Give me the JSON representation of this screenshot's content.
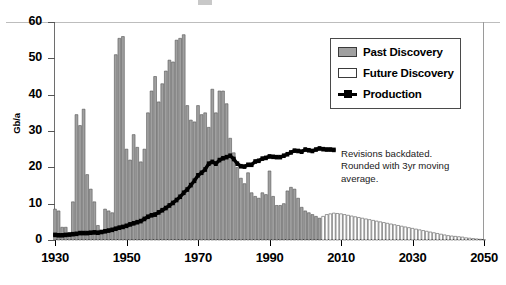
{
  "chart_data": {
    "type": "bar",
    "title": "",
    "xlabel": "",
    "ylabel": "Gb/a",
    "xlim": [
      1930,
      2050
    ],
    "ylim": [
      0,
      60
    ],
    "grid": false,
    "legend_position": "top-right",
    "y_ticks": [
      0,
      10,
      20,
      30,
      40,
      50,
      60
    ],
    "x_ticks": [
      1930,
      1950,
      1970,
      1990,
      2010,
      2030,
      2050
    ],
    "legend": [
      {
        "name": "Past Discovery",
        "type": "bar",
        "color": "#a0a0a0"
      },
      {
        "name": "Future Discovery",
        "type": "bar",
        "color": "#ffffff"
      },
      {
        "name": "Production",
        "type": "line",
        "color": "#000000"
      }
    ],
    "annotations": [
      "Revisions backdated.",
      "Rounded with 3yr moving",
      "average."
    ],
    "series": [
      {
        "name": "Past Discovery",
        "type": "bar",
        "color": "#a0a0a0",
        "x": [
          1930,
          1931,
          1932,
          1933,
          1934,
          1935,
          1936,
          1937,
          1938,
          1939,
          1940,
          1941,
          1942,
          1943,
          1944,
          1945,
          1946,
          1947,
          1948,
          1949,
          1950,
          1951,
          1952,
          1953,
          1954,
          1955,
          1956,
          1957,
          1958,
          1959,
          1960,
          1961,
          1962,
          1963,
          1964,
          1965,
          1966,
          1967,
          1968,
          1969,
          1970,
          1971,
          1972,
          1973,
          1974,
          1975,
          1976,
          1977,
          1978,
          1979,
          1980,
          1981,
          1982,
          1983,
          1984,
          1985,
          1986,
          1987,
          1988,
          1989,
          1990,
          1991,
          1992,
          1993,
          1994,
          1995,
          1996,
          1997,
          1998,
          1999,
          2000,
          2001,
          2002,
          2003,
          2004
        ],
        "values": [
          8.5,
          8.0,
          3.5,
          3.5,
          1.5,
          10.5,
          34.5,
          31.5,
          36.0,
          18.0,
          14.0,
          10.5,
          4.0,
          2.0,
          8.5,
          8.0,
          7.5,
          51.0,
          55.5,
          56.0,
          25.0,
          22.0,
          29.0,
          25.5,
          21.5,
          25.0,
          35.0,
          41.0,
          45.0,
          38.0,
          43.0,
          46.5,
          49.5,
          49.0,
          55.0,
          55.5,
          56.5,
          37.0,
          33.0,
          32.5,
          37.0,
          34.5,
          35.0,
          31.0,
          41.5,
          35.0,
          41.0,
          41.0,
          37.5,
          28.0,
          24.0,
          20.0,
          17.0,
          15.5,
          18.5,
          13.0,
          12.0,
          11.5,
          13.0,
          12.5,
          19.0,
          12.0,
          9.5,
          9.5,
          10.0,
          13.5,
          14.5,
          14.0,
          11.5,
          9.0,
          8.0,
          7.5,
          7.0,
          6.5,
          6.0
        ]
      },
      {
        "name": "Future Discovery",
        "type": "bar",
        "color": "#ffffff",
        "x": [
          2005,
          2006,
          2007,
          2008,
          2009,
          2010,
          2011,
          2012,
          2013,
          2014,
          2015,
          2016,
          2017,
          2018,
          2019,
          2020,
          2021,
          2022,
          2023,
          2024,
          2025,
          2026,
          2027,
          2028,
          2029,
          2030,
          2031,
          2032,
          2033,
          2034,
          2035,
          2036,
          2037,
          2038,
          2039,
          2040,
          2041,
          2042,
          2043,
          2044,
          2045,
          2046,
          2047,
          2048,
          2049,
          2050
        ],
        "values": [
          6.5,
          7.0,
          7.2,
          7.4,
          7.3,
          7.2,
          7.0,
          6.8,
          6.6,
          6.4,
          6.2,
          6.0,
          5.8,
          5.6,
          5.4,
          5.2,
          5.0,
          4.8,
          4.6,
          4.4,
          4.2,
          4.0,
          3.8,
          3.6,
          3.4,
          3.2,
          3.0,
          2.8,
          2.6,
          2.4,
          2.2,
          2.0,
          1.8,
          1.6,
          1.4,
          1.2,
          1.1,
          1.0,
          0.9,
          0.8,
          0.6,
          0.5,
          0.4,
          0.3,
          0.2,
          0.1
        ]
      },
      {
        "name": "Production",
        "type": "line",
        "color": "#000000",
        "x": [
          1930,
          1931,
          1932,
          1933,
          1934,
          1935,
          1936,
          1937,
          1938,
          1939,
          1940,
          1941,
          1942,
          1943,
          1944,
          1945,
          1946,
          1947,
          1948,
          1949,
          1950,
          1951,
          1952,
          1953,
          1954,
          1955,
          1956,
          1957,
          1958,
          1959,
          1960,
          1961,
          1962,
          1963,
          1964,
          1965,
          1966,
          1967,
          1968,
          1969,
          1970,
          1971,
          1972,
          1973,
          1974,
          1975,
          1976,
          1977,
          1978,
          1979,
          1980,
          1981,
          1982,
          1983,
          1984,
          1985,
          1986,
          1987,
          1988,
          1989,
          1990,
          1991,
          1992,
          1993,
          1994,
          1995,
          1996,
          1997,
          1998,
          1999,
          2000,
          2001,
          2002,
          2003,
          2004,
          2005,
          2006,
          2007,
          2008
        ],
        "values": [
          1.4,
          1.3,
          1.3,
          1.4,
          1.5,
          1.6,
          1.7,
          1.9,
          1.9,
          1.9,
          2.0,
          2.1,
          2.0,
          2.2,
          2.4,
          2.6,
          2.8,
          3.1,
          3.4,
          3.6,
          3.9,
          4.3,
          4.6,
          4.9,
          5.2,
          5.8,
          6.4,
          6.8,
          7.0,
          7.6,
          8.2,
          8.8,
          9.5,
          10.2,
          11.0,
          11.9,
          13.0,
          13.9,
          15.1,
          16.3,
          17.8,
          18.5,
          19.4,
          21.0,
          21.5,
          21.0,
          22.0,
          22.5,
          22.8,
          23.2,
          22.3,
          21.0,
          20.3,
          20.2,
          20.7,
          20.7,
          21.6,
          21.8,
          22.4,
          22.6,
          23.0,
          22.9,
          22.8,
          22.8,
          23.2,
          23.6,
          24.1,
          24.6,
          24.5,
          24.3,
          24.9,
          24.7,
          24.5,
          24.9,
          25.2,
          25.0,
          24.9,
          24.9,
          24.8
        ]
      }
    ]
  }
}
